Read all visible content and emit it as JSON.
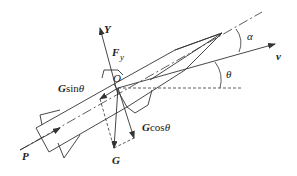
{
  "figure": {
    "labels": {
      "Y_axis": "Y",
      "lift": "F",
      "lift_sub": "y",
      "origin": "O",
      "weight_sin_bold": "G",
      "weight_sin_fn": "sin",
      "weight_sin_var": "θ",
      "weight_cos_bold": "G",
      "weight_cos_fn": "cos",
      "weight_cos_var": "θ",
      "weight": "G",
      "thrust": "P",
      "velocity": "v",
      "attack_angle": "α",
      "flight_path_angle": "θ"
    },
    "colors": {
      "line": "#333333",
      "background": "#ffffff"
    }
  }
}
